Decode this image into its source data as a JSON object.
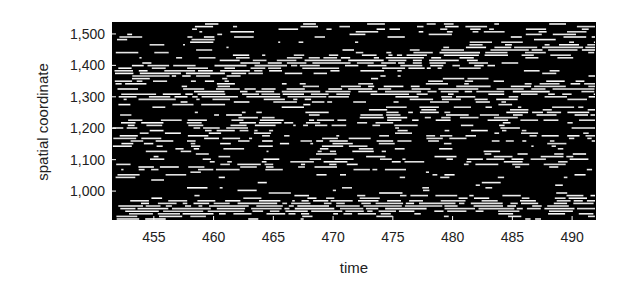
{
  "chart_data": {
    "type": "raster",
    "title": "",
    "xlabel": "time",
    "ylabel": "spatial coordinate",
    "xlim": [
      451.5,
      492.0
    ],
    "ylim": [
      908,
      1538
    ],
    "x_ticks": [
      455,
      460,
      465,
      470,
      475,
      480,
      485,
      490
    ],
    "x_tick_labels": [
      "455",
      "460",
      "465",
      "470",
      "475",
      "480",
      "485",
      "490"
    ],
    "y_ticks": [
      1000,
      1100,
      1200,
      1300,
      1400,
      1500
    ],
    "y_tick_labels": [
      "1,000",
      "1,100",
      "1,200",
      "1,300",
      "1,400",
      "1,500"
    ],
    "grid": false,
    "legend": null,
    "background_color": "#000000",
    "line_color": "#ffffff",
    "bands": [
      {
        "y_start": 1525,
        "y_end": 1498,
        "density": 0.35,
        "label": "top band"
      },
      {
        "y_start": 1370,
        "y_end": 1460,
        "density": 0.85,
        "label": "upper band rising"
      },
      {
        "y_start": 1300,
        "y_end": 1330,
        "density": 0.8,
        "label": "upper-middle band"
      },
      {
        "y_start": 1215,
        "y_end": 1250,
        "density": 0.55,
        "label": "middle band"
      },
      {
        "y_start": 1150,
        "y_end": 1170,
        "density": 0.4,
        "label": "lower-middle band"
      },
      {
        "y_start": 1070,
        "y_end": 1110,
        "density": 0.35,
        "label": "sparse band"
      },
      {
        "y_start": 940,
        "y_end": 960,
        "density": 0.9,
        "label": "bottom band"
      }
    ]
  },
  "plot": {
    "left": 112,
    "top": 22,
    "right": 596,
    "bottom": 220
  }
}
